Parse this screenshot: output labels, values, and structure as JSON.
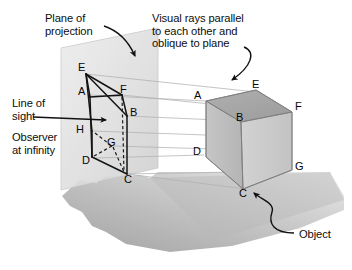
{
  "figure": {
    "background_color": "#ffffff",
    "text_color": "#0d0d0d"
  },
  "annotations": {
    "plane_of_projection": "Plane of\nprojection",
    "visual_rays": "Visual rays parallel\nto each other and\noblique to plane",
    "line_of_sight": "Line of\nsight",
    "observer_at_infinity": "Observer\nat infinity",
    "object": "Object"
  },
  "projected_view": {
    "name": "projected-wireframe",
    "vertices": [
      {
        "label": "E",
        "x": 84,
        "y": 70
      },
      {
        "label": "A",
        "x": 83,
        "y": 92
      },
      {
        "label": "F",
        "x": 124,
        "y": 92
      },
      {
        "label": "B",
        "x": 130,
        "y": 113
      },
      {
        "label": "H",
        "x": 83,
        "y": 128
      },
      {
        "label": "G",
        "x": 111,
        "y": 143
      },
      {
        "label": "D",
        "x": 88,
        "y": 157
      },
      {
        "label": "C",
        "x": 129,
        "y": 173
      }
    ]
  },
  "object_view": {
    "name": "cube-object",
    "vertices": [
      {
        "label": "A",
        "x": 203,
        "y": 98
      },
      {
        "label": "E",
        "x": 255,
        "y": 87
      },
      {
        "label": "B",
        "x": 240,
        "y": 117
      },
      {
        "label": "F",
        "x": 288,
        "y": 108
      },
      {
        "label": "D",
        "x": 201,
        "y": 152
      },
      {
        "label": "C",
        "x": 244,
        "y": 187
      },
      {
        "label": "G",
        "x": 290,
        "y": 168
      }
    ]
  },
  "colors": {
    "plane_fill_light": "#e4e4e4",
    "plane_fill_dark": "#c9c9c9",
    "ground_light": "#d8d8d8",
    "ground_dark": "#a8a8a8",
    "cube_top": "#a6a6a6",
    "cube_front": "#bdbdbd",
    "cube_right": "#cfcfcf",
    "ray_color": "#b3b3b3",
    "line_color": "#1a1a1a"
  }
}
